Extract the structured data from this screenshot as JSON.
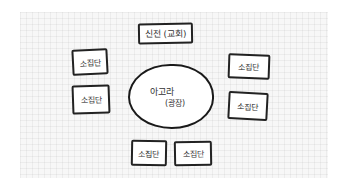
{
  "diagram": {
    "title": "",
    "nodes": {
      "temple": {
        "label": "신전 (교회)"
      },
      "agora": {
        "line1": "아고라",
        "line2": "(광장)"
      },
      "groups": [
        {
          "label": "소집단",
          "position": "left-top"
        },
        {
          "label": "소집단",
          "position": "left-bottom"
        },
        {
          "label": "소집단",
          "position": "right-top"
        },
        {
          "label": "소집단",
          "position": "right-bottom"
        },
        {
          "label": "소집단",
          "position": "bottom-left"
        },
        {
          "label": "소집단",
          "position": "bottom-right"
        }
      ]
    },
    "colors": {
      "stroke": "#222222",
      "paper": "#f7f7f7",
      "text": "#333333"
    }
  }
}
